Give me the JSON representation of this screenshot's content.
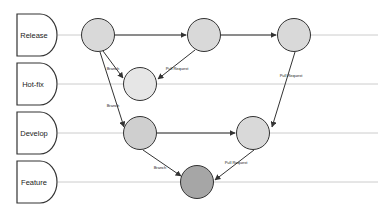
{
  "diagram": {
    "lanes": [
      {
        "id": "release",
        "label": "Release",
        "y": 35
      },
      {
        "id": "hotfix",
        "label": "Hot-fix",
        "y": 84
      },
      {
        "id": "develop",
        "label": "Develop",
        "y": 133
      },
      {
        "id": "feature",
        "label": "Feature",
        "y": 182
      }
    ],
    "nodes": [
      {
        "id": "r1",
        "lane": "release",
        "x": 98,
        "y": 35,
        "fill": "#d9d9d9"
      },
      {
        "id": "r2",
        "lane": "release",
        "x": 204,
        "y": 35,
        "fill": "#d9d9d9"
      },
      {
        "id": "r3",
        "lane": "release",
        "x": 294,
        "y": 35,
        "fill": "#d9d9d9"
      },
      {
        "id": "h1",
        "lane": "hotfix",
        "x": 140,
        "y": 84,
        "fill": "#e6e6e6"
      },
      {
        "id": "d1",
        "lane": "develop",
        "x": 140,
        "y": 133,
        "fill": "#cfcfcf"
      },
      {
        "id": "d2",
        "lane": "develop",
        "x": 253,
        "y": 133,
        "fill": "#d9d9d9"
      },
      {
        "id": "f1",
        "lane": "feature",
        "x": 197,
        "y": 182,
        "fill": "#a6a6a6"
      }
    ],
    "edges": [
      {
        "from": "r1",
        "to": "r2",
        "label": ""
      },
      {
        "from": "r2",
        "to": "r3",
        "label": ""
      },
      {
        "from": "r1",
        "to": "h1",
        "label": "Branch"
      },
      {
        "from": "r2",
        "to": "h1",
        "label": "Pull Request"
      },
      {
        "from": "r1",
        "to": "d1",
        "label": "Branch"
      },
      {
        "from": "r3",
        "to": "d2",
        "label": "Pull Request"
      },
      {
        "from": "d1",
        "to": "d2",
        "label": ""
      },
      {
        "from": "d1",
        "to": "f1",
        "label": "Branch"
      },
      {
        "from": "d2",
        "to": "f1",
        "label": "Pull Request"
      }
    ],
    "colors": {
      "stroke": "#333333",
      "lane_line": "#cccccc"
    }
  }
}
